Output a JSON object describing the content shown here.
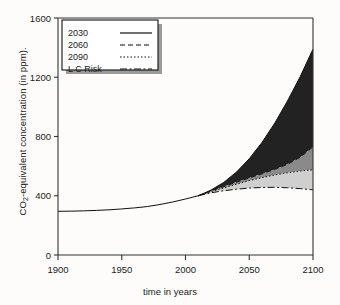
{
  "chart_data": {
    "type": "area",
    "title": "",
    "xlabel": "time in years",
    "ylabel": "CO2-equivalent concentration (in ppm).",
    "ylabel_prefix": "CO",
    "ylabel_sub": "2",
    "ylabel_suffix": "-equivalent concentration (in ppm).",
    "xlim": [
      1900,
      2100
    ],
    "ylim": [
      0,
      1600
    ],
    "xticks": [
      1900,
      1950,
      2000,
      2050,
      2100
    ],
    "yticks": [
      0,
      400,
      800,
      1200,
      1600
    ],
    "xtick_labels": [
      "1900",
      "1950",
      "2000",
      "2050",
      "2100"
    ],
    "ytick_labels": [
      "0",
      "400",
      "800",
      "1200",
      "1600"
    ],
    "grid": false,
    "legend_position": "upper-left",
    "legend_entries": [
      {
        "label": "2030",
        "style": "solid"
      },
      {
        "label": "2060",
        "style": "dashed"
      },
      {
        "label": "2090",
        "style": "dotted"
      },
      {
        "label": "L C Risk",
        "style": "dash-dot"
      }
    ],
    "colors": {
      "band_dark": "#222222",
      "band_medium": "#8a8a8a",
      "band_light": "#cfcfcf",
      "line": "#111111",
      "axis": "#333333",
      "background": "#fdfcfa"
    },
    "x": [
      1900,
      1910,
      1920,
      1930,
      1940,
      1950,
      1960,
      1970,
      1980,
      1990,
      2000,
      2010,
      2020,
      2030,
      2040,
      2050,
      2060,
      2070,
      2080,
      2090,
      2100
    ],
    "series": [
      {
        "name": "historical",
        "values": [
          295,
          296,
          298,
          301,
          305,
          311,
          318,
          327,
          341,
          358,
          378,
          400,
          0,
          0,
          0,
          0,
          0,
          0,
          0,
          0,
          0
        ]
      },
      {
        "name": "2030",
        "note": "upper envelope of dark band (no mitigation)",
        "values": [
          295,
          296,
          298,
          301,
          305,
          311,
          318,
          327,
          341,
          358,
          378,
          400,
          438,
          490,
          560,
          650,
          760,
          890,
          1040,
          1205,
          1390
        ]
      },
      {
        "name": "2060",
        "note": "lower boundary of dark band / top of medium gray band",
        "values": [
          295,
          296,
          298,
          301,
          305,
          311,
          318,
          327,
          341,
          358,
          378,
          400,
          432,
          462,
          492,
          520,
          548,
          578,
          612,
          660,
          730
        ]
      },
      {
        "name": "2090",
        "note": "top of light gray band",
        "values": [
          295,
          296,
          298,
          301,
          305,
          311,
          318,
          327,
          341,
          358,
          378,
          400,
          428,
          452,
          478,
          502,
          522,
          540,
          555,
          567,
          575
        ]
      },
      {
        "name": "L C Risk",
        "note": "lower envelope, low-climate-risk pathway",
        "values": [
          295,
          296,
          298,
          301,
          305,
          311,
          318,
          327,
          341,
          358,
          378,
          400,
          420,
          434,
          444,
          452,
          456,
          457,
          454,
          448,
          440
        ]
      }
    ]
  }
}
